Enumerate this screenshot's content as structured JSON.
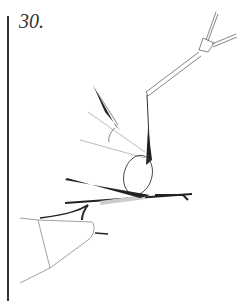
{
  "figure": {
    "step_number": "30.",
    "illustration": "fly-tying-step-diagram",
    "colors": {
      "line": "#333333",
      "thin_line": "#999999",
      "background": "#ffffff"
    }
  }
}
